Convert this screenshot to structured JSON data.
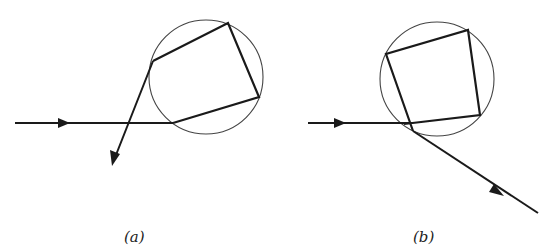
{
  "figures": [
    {
      "id": "a",
      "caption": "(a)",
      "circle": {
        "cx": 206,
        "cy": 77,
        "r": 57
      },
      "incoming_ray": {
        "x1": 15,
        "y1": 123,
        "x2": 173,
        "y2": 123,
        "arrow_at": [
          68,
          123
        ]
      },
      "internal_path": [
        [
          173,
          123
        ],
        [
          259,
          97
        ],
        [
          228,
          23
        ],
        [
          153,
          61
        ]
      ],
      "outgoing_ray": {
        "x1": 153,
        "y1": 61,
        "x2": 112,
        "y2": 165
      }
    },
    {
      "id": "b",
      "caption": "(b)",
      "circle": {
        "cx": 437,
        "cy": 79,
        "r": 57
      },
      "incoming_ray": {
        "x1": 308,
        "y1": 123,
        "x2": 413,
        "y2": 123,
        "arrow_at": [
          345,
          123
        ]
      },
      "internal_path": [
        [
          413,
          123
        ],
        [
          480,
          115
        ],
        [
          468,
          30
        ],
        [
          386,
          54
        ],
        [
          413,
          131
        ]
      ],
      "outgoing_ray": {
        "x1": 413,
        "y1": 131,
        "x2": 538,
        "y2": 213
      }
    }
  ],
  "captions": {
    "a": "(a)",
    "b": "(b)"
  },
  "colors": {
    "ray": "#1a1a1a",
    "circle": "#444444",
    "background": "#ffffff"
  }
}
